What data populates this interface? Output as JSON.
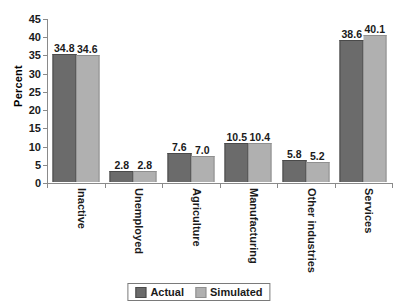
{
  "chart_data": {
    "type": "bar",
    "title": "",
    "xlabel": "",
    "ylabel": "Percent",
    "ylim": [
      0,
      45
    ],
    "yticks": [
      0,
      5,
      10,
      15,
      20,
      25,
      30,
      35,
      40,
      45
    ],
    "grid": false,
    "legend_position": "bottom-center",
    "categories": [
      "Inactive",
      "Unemployed",
      "Agriculture",
      "Manufacturing",
      "Other industries",
      "Services"
    ],
    "series": [
      {
        "name": "Actual",
        "color": "#6b6b6b",
        "values": [
          34.8,
          2.8,
          7.6,
          10.5,
          5.8,
          38.6
        ],
        "labels": [
          "34.8",
          "2.8",
          "7.6",
          "10.5",
          "5.8",
          "38.6"
        ]
      },
      {
        "name": "Simulated",
        "color": "#b0b0b0",
        "values": [
          34.6,
          2.8,
          7.0,
          10.4,
          5.2,
          40.1
        ],
        "labels": [
          "34.6",
          "2.8",
          "7.0",
          "10.4",
          "5.2",
          "40.1"
        ]
      }
    ]
  },
  "axis": {
    "y_title": "Percent",
    "y_tick_labels": [
      "45",
      "40",
      "35",
      "30",
      "25",
      "20",
      "15",
      "10",
      "5",
      "0"
    ]
  },
  "legend": {
    "items": [
      {
        "label": "Actual",
        "color": "#6b6b6b"
      },
      {
        "label": "Simulated",
        "color": "#b0b0b0"
      }
    ]
  }
}
